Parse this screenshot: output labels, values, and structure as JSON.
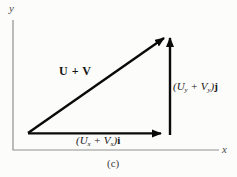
{
  "figure": {
    "caption": "(c)",
    "axes": {
      "x_label": "x",
      "y_label": "y"
    },
    "vectors": {
      "sum_label": "U + V",
      "x_component": {
        "open": "(U",
        "sub1": "x",
        "mid": " + V",
        "sub2": "x",
        "close": ")",
        "unit": "i"
      },
      "y_component": {
        "open": "(U",
        "sub1": "y",
        "mid": " + V",
        "sub2": "y",
        "close": ")",
        "unit": "j"
      }
    },
    "colors": {
      "vector": "#0a0a0a",
      "axis": "#8f8f8f",
      "text": "#151515"
    }
  }
}
